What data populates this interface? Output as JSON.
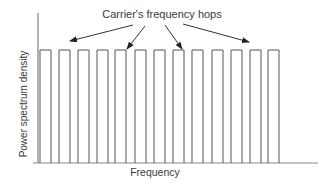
{
  "title": "Carrier's frequency hops",
  "axes": {
    "x_label": "Frequency",
    "y_label": "Power spectrum density"
  },
  "colors": {
    "line": "#555555",
    "arrow": "#333333",
    "text": "#3a3a3a",
    "background": "#ffffff"
  },
  "bars": [
    {
      "x": 40,
      "w": 11
    },
    {
      "x": 59,
      "w": 11
    },
    {
      "x": 78,
      "w": 11
    },
    {
      "x": 97,
      "w": 11
    },
    {
      "x": 115,
      "w": 11
    },
    {
      "x": 135,
      "w": 11
    },
    {
      "x": 154,
      "w": 11
    },
    {
      "x": 173,
      "w": 11
    },
    {
      "x": 192,
      "w": 11
    },
    {
      "x": 212,
      "w": 11
    },
    {
      "x": 231,
      "w": 11
    },
    {
      "x": 250,
      "w": 11
    },
    {
      "x": 268,
      "w": 11
    }
  ],
  "bar_top": 50,
  "baseline": 163,
  "arrows": [
    {
      "x1": 133,
      "y1": 25,
      "x2": 70,
      "y2": 41
    },
    {
      "x1": 145,
      "y1": 26,
      "x2": 127,
      "y2": 49
    },
    {
      "x1": 165,
      "y1": 25,
      "x2": 182,
      "y2": 49
    },
    {
      "x1": 183,
      "y1": 24,
      "x2": 249,
      "y2": 42
    }
  ]
}
